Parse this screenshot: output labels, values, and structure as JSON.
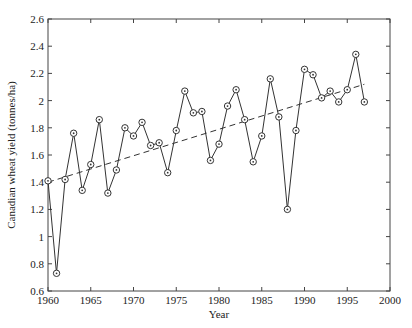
{
  "chart_data": {
    "type": "line",
    "title": "",
    "xlabel": "Year",
    "ylabel": "Canadian wheat yield (tonnes/ha)",
    "xlim": [
      1960,
      2000
    ],
    "ylim": [
      0.6,
      2.6
    ],
    "xticks": [
      1960,
      1965,
      1970,
      1975,
      1980,
      1985,
      1990,
      1995,
      2000
    ],
    "yticks": [
      0.6,
      0.8,
      1,
      1.2,
      1.4,
      1.6,
      1.8,
      2,
      2.2,
      2.4,
      2.6
    ],
    "xtick_labels": [
      "1960",
      "1965",
      "1970",
      "1975",
      "1980",
      "1985",
      "1990",
      "1995",
      "2000"
    ],
    "ytick_labels": [
      "0.6",
      "0.8",
      "1",
      "1.2",
      "1.4",
      "1.6",
      "1.8",
      "2",
      "2.2",
      "2.4",
      "2.6"
    ],
    "grid": false,
    "legend": null,
    "series": [
      {
        "name": "Annual yield",
        "style": "solid line with circle markers",
        "color": "#333333",
        "x": [
          1960,
          1961,
          1962,
          1963,
          1964,
          1965,
          1966,
          1967,
          1968,
          1969,
          1970,
          1971,
          1972,
          1973,
          1974,
          1975,
          1976,
          1977,
          1978,
          1979,
          1980,
          1981,
          1982,
          1983,
          1984,
          1985,
          1986,
          1987,
          1988,
          1989,
          1990,
          1991,
          1992,
          1993,
          1994,
          1995,
          1996,
          1997
        ],
        "values": [
          1.41,
          0.73,
          1.42,
          1.76,
          1.34,
          1.53,
          1.86,
          1.32,
          1.49,
          1.8,
          1.74,
          1.84,
          1.67,
          1.69,
          1.47,
          1.78,
          2.07,
          1.91,
          1.92,
          1.56,
          1.68,
          1.96,
          2.08,
          1.86,
          1.55,
          1.74,
          2.16,
          1.88,
          1.2,
          1.78,
          2.23,
          2.19,
          2.02,
          2.07,
          1.99,
          2.08,
          2.34,
          1.99
        ]
      },
      {
        "name": "Linear trend",
        "style": "dashed line",
        "color": "#333333",
        "x": [
          1960,
          1997
        ],
        "values": [
          1.4,
          2.12
        ]
      }
    ]
  }
}
